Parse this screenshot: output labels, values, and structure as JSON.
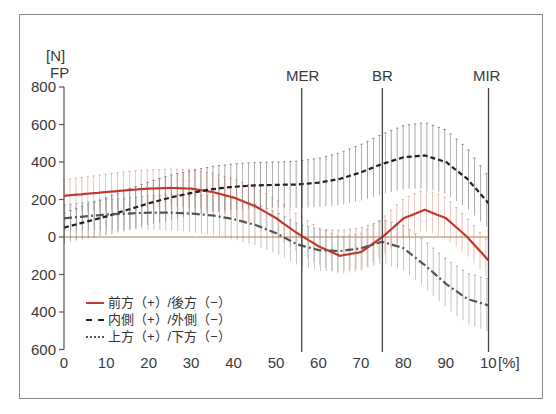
{
  "chart_data": {
    "type": "line",
    "title": "",
    "ylabel": "[N]",
    "ylabel_sub": "FP",
    "xlabel": "[%]",
    "ylim": [
      -600,
      800
    ],
    "xlim": [
      0,
      100
    ],
    "y_ticks": [
      800,
      600,
      400,
      200,
      0,
      200,
      400,
      600
    ],
    "y_tick_values": [
      800,
      600,
      400,
      200,
      0,
      -200,
      -400,
      -600
    ],
    "x_ticks": [
      "0",
      "10",
      "20",
      "30",
      "40",
      "50",
      "60",
      "70",
      "80",
      "90",
      "10"
    ],
    "x_unit": "[%]",
    "grid": false,
    "error_bars": true,
    "events": [
      {
        "label": "MER",
        "x": 56
      },
      {
        "label": "BR",
        "x": 75
      },
      {
        "label": "MIR",
        "x": 100
      }
    ],
    "x": [
      0,
      5,
      10,
      15,
      20,
      25,
      30,
      35,
      40,
      45,
      50,
      55,
      60,
      65,
      70,
      75,
      80,
      85,
      90,
      95,
      100
    ],
    "series": [
      {
        "name": "前方（+）/後方（−）",
        "style": "solid",
        "color": "#c0392b",
        "values": [
          220,
          230,
          240,
          250,
          258,
          262,
          258,
          240,
          210,
          165,
          100,
          20,
          -50,
          -100,
          -80,
          0,
          100,
          145,
          100,
          0,
          -125
        ],
        "sd": [
          85,
          90,
          95,
          100,
          100,
          100,
          100,
          100,
          100,
          100,
          100,
          100,
          100,
          100,
          100,
          100,
          105,
          110,
          110,
          100,
          100
        ]
      },
      {
        "name": "内側（+）/外側（−）",
        "style": "dashed",
        "color": "#222222",
        "values": [
          50,
          80,
          110,
          145,
          180,
          210,
          235,
          255,
          268,
          275,
          278,
          280,
          290,
          310,
          345,
          390,
          425,
          435,
          400,
          310,
          180
        ],
        "sd": [
          80,
          90,
          100,
          110,
          115,
          120,
          120,
          122,
          122,
          122,
          122,
          125,
          130,
          140,
          150,
          160,
          170,
          175,
          170,
          160,
          140
        ]
      },
      {
        "name": "上方（+）/下方（−）",
        "style": "dashdot",
        "color": "#555555",
        "values": [
          100,
          110,
          120,
          125,
          130,
          130,
          125,
          115,
          95,
          65,
          20,
          -40,
          -70,
          -75,
          -60,
          -25,
          -60,
          -150,
          -250,
          -330,
          -365
        ],
        "sd": [
          70,
          75,
          80,
          85,
          90,
          95,
          100,
          105,
          110,
          110,
          110,
          110,
          110,
          110,
          110,
          115,
          120,
          125,
          130,
          135,
          140
        ]
      }
    ],
    "legend_position": "lower-left"
  }
}
